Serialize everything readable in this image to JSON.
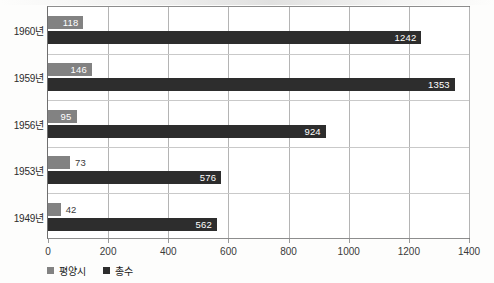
{
  "chart_data": {
    "type": "bar",
    "orientation": "horizontal",
    "title": "",
    "xlabel": "",
    "ylabel": "",
    "categories": [
      "1960년",
      "1959년",
      "1956년",
      "1953년",
      "1949년"
    ],
    "series": [
      {
        "name": "평양시",
        "color": "#828282",
        "values": [
          118,
          146,
          95,
          73,
          42
        ]
      },
      {
        "name": "총수",
        "color": "#2d2d2d",
        "values": [
          1242,
          1353,
          924,
          576,
          562
        ]
      }
    ],
    "xlim": [
      0,
      1400
    ],
    "xticks": [
      0,
      200,
      400,
      600,
      800,
      1000,
      1200,
      1400
    ],
    "xtick_labels": [
      "0",
      "200",
      "400",
      "600",
      "800",
      "1000",
      "1200",
      "1400"
    ],
    "grid": true,
    "grid_axis": "x",
    "legend_position": "bottom-left",
    "data_labels": true
  },
  "colors": {
    "series_pyongyang": "#828282",
    "series_total": "#2d2d2d",
    "gridline": "#b4b4b4",
    "frame": "#6f6f6f",
    "label_inside": "#ffffff",
    "label_outside": "#3a3a3a",
    "background": "#ffffff"
  },
  "legend": {
    "items": [
      {
        "label": "평양시"
      },
      {
        "label": "총수"
      }
    ]
  }
}
